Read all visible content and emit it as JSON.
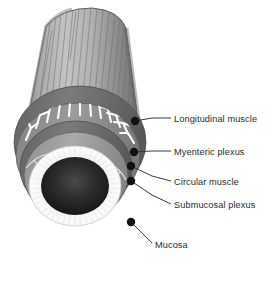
{
  "figure": {
    "background_color": "#ffffff",
    "line_color": "#3a3a3a",
    "text_color": "#2b2b2b",
    "marker_color": "#111111"
  },
  "labels": [
    {
      "id": "longitudinal-muscle",
      "text": "Longitudinal muscle",
      "text_x": 174,
      "text_y": 114,
      "dot_x": 135,
      "dot_y": 121,
      "dot_r": 4.2,
      "leader": "135,121 152,118 171,118"
    },
    {
      "id": "myenteric-plexus",
      "text": "Myenteric plexus",
      "text_x": 174,
      "text_y": 147,
      "dot_x": 134,
      "dot_y": 152,
      "dot_r": 4.2,
      "leader": "134,152 152,151 171,151"
    },
    {
      "id": "circular-muscle",
      "text": "Circular muscle",
      "text_x": 174,
      "text_y": 177,
      "dot_x": 131,
      "dot_y": 166,
      "dot_r": 4.2,
      "leader": "131,166 152,176 171,181"
    },
    {
      "id": "submucosal-plexus",
      "text": "Submucosal plexus",
      "text_x": 174,
      "text_y": 200,
      "dot_x": 131,
      "dot_y": 181,
      "dot_r": 4.2,
      "leader": "131,181 152,195 171,204"
    },
    {
      "id": "mucosa",
      "text": "Mucosa",
      "text_x": 155,
      "text_y": 240,
      "dot_x": 131,
      "dot_y": 222,
      "dot_r": 4.2,
      "leader": "131,222 143,234 152,243"
    }
  ],
  "anatomy": {
    "tube_label": "longitudinal-muscle-tube",
    "rings": [
      {
        "id": "longitudinal-muscle-ring",
        "color": "#6e6e6e"
      },
      {
        "id": "myenteric-plexus-ring",
        "color": "#8d8d8d"
      },
      {
        "id": "circular-muscle-ring",
        "color": "#6b6b6b"
      },
      {
        "id": "submucosal-plexus-ring",
        "color": "#9a9a9a"
      },
      {
        "id": "mucosa-ring",
        "color": "#f2f2f2"
      },
      {
        "id": "lumen",
        "color": "#1e1e1e"
      }
    ],
    "villi_count": 46,
    "myenteric_fiber_count": 17,
    "longitudinal_striation_count": 19
  }
}
